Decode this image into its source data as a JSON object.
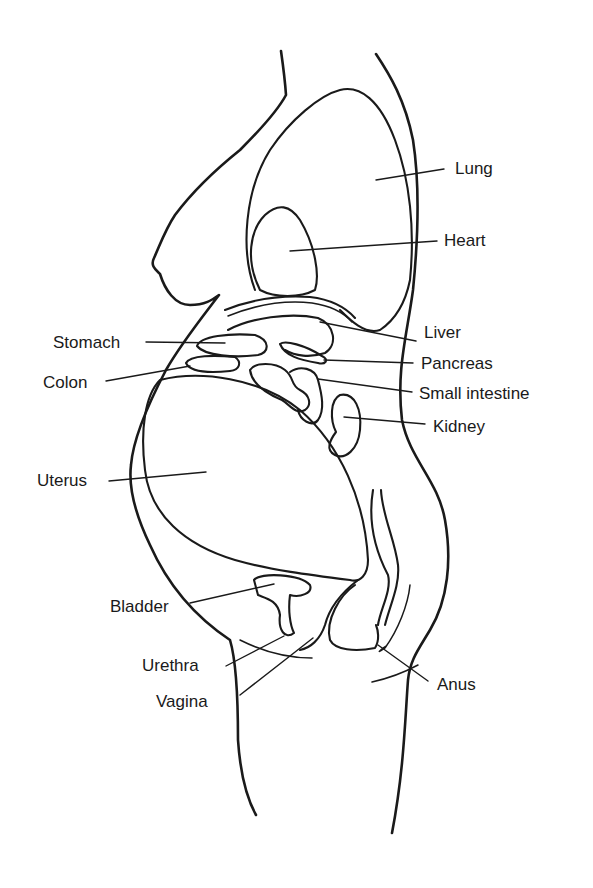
{
  "diagram": {
    "type": "anatomical-illustration",
    "colors": {
      "line": "#1a1a1a",
      "background": "#ffffff"
    },
    "labels": {
      "lung": "Lung",
      "heart": "Heart",
      "liver": "Liver",
      "stomach": "Stomach",
      "pancreas": "Pancreas",
      "colon": "Colon",
      "small_intestine": "Small intestine",
      "kidney": "Kidney",
      "uterus": "Uterus",
      "bladder": "Bladder",
      "urethra": "Urethra",
      "vagina": "Vagina",
      "anus": "Anus"
    }
  }
}
